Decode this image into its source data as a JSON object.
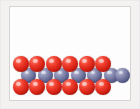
{
  "figure": {
    "kind": "molecular-packing-model",
    "description": "Close-packed sphere model of an ionic crystal lattice",
    "frame": {
      "border_color": "#d6d4d4",
      "background_color": "#fdfdfd",
      "page_background_color": "#f3f2f1"
    }
  },
  "legend": {
    "species": [
      {
        "name": "red-sphere",
        "label": "",
        "color": "#d21f14",
        "highlight": "#ff8b7e",
        "shadow": "#5e0a05"
      },
      {
        "name": "blue-sphere",
        "label": "",
        "color": "#5f6390",
        "highlight": "#b9bdd6",
        "shadow": "#282a45"
      }
    ]
  },
  "chart_data": {
    "type": "scatter",
    "title": "",
    "subtitle": "",
    "xlabel": "",
    "ylabel": "",
    "xlim": [
      0,
      122
    ],
    "ylim": [
      0,
      95
    ],
    "grid": false,
    "legend_position": "none",
    "note": "Packed-sphere lattice: three rows. Top and bottom rows are red spheres (6 each); middle row is blue spheres (7), offset by half a diameter so each blue sphere nests between two red spheres.",
    "series": [
      {
        "name": "red-sphere",
        "color": "#d21f14",
        "marker": "sphere",
        "radius": 8.0,
        "count": 12,
        "points": [
          {
            "x": 10.5,
            "y": 57.0,
            "row": "top"
          },
          {
            "x": 27.0,
            "y": 57.0,
            "row": "top"
          },
          {
            "x": 43.5,
            "y": 57.0,
            "row": "top"
          },
          {
            "x": 60.0,
            "y": 57.0,
            "row": "top"
          },
          {
            "x": 76.5,
            "y": 57.0,
            "row": "top"
          },
          {
            "x": 93.0,
            "y": 57.0,
            "row": "top"
          },
          {
            "x": 10.5,
            "y": 80.0,
            "row": "bottom"
          },
          {
            "x": 27.0,
            "y": 80.0,
            "row": "bottom"
          },
          {
            "x": 43.5,
            "y": 80.0,
            "row": "bottom"
          },
          {
            "x": 60.0,
            "y": 80.0,
            "row": "bottom"
          },
          {
            "x": 76.5,
            "y": 80.0,
            "row": "bottom"
          },
          {
            "x": 93.0,
            "y": 80.0,
            "row": "bottom"
          }
        ]
      },
      {
        "name": "blue-sphere",
        "color": "#5f6390",
        "marker": "sphere",
        "radius": 7.4,
        "count": 7,
        "points": [
          {
            "x": 18.7,
            "y": 68.5,
            "row": "middle"
          },
          {
            "x": 35.2,
            "y": 68.5,
            "row": "middle"
          },
          {
            "x": 51.7,
            "y": 68.5,
            "row": "middle"
          },
          {
            "x": 68.2,
            "y": 68.5,
            "row": "middle"
          },
          {
            "x": 84.7,
            "y": 68.5,
            "row": "middle"
          },
          {
            "x": 101.2,
            "y": 68.5,
            "row": "middle"
          },
          {
            "x": 112.5,
            "y": 68.5,
            "row": "middle"
          }
        ]
      }
    ]
  }
}
